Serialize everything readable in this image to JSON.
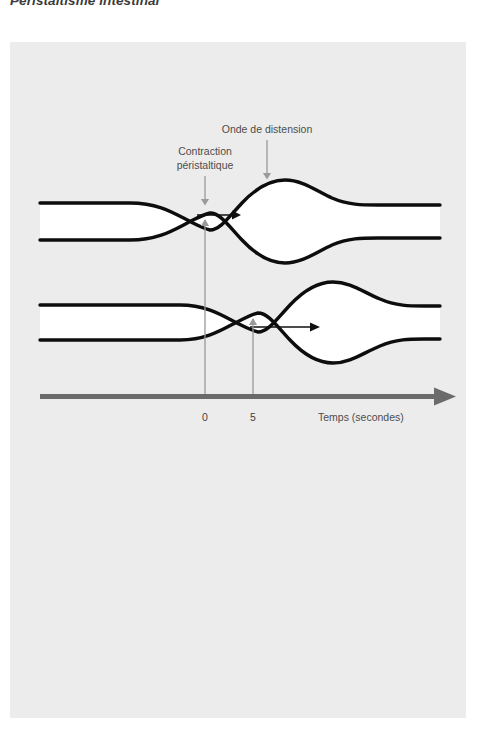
{
  "figure": {
    "title": "Péristaltisme intestinal",
    "panel_bg": "#ececed",
    "labels": {
      "contraction_line1": "Contraction",
      "contraction_line2": "péristaltique",
      "distension": "Onde de distension",
      "axis": "Temps (secondes)"
    },
    "axis": {
      "ticks": [
        {
          "value": "0",
          "x": 205
        },
        {
          "value": "5",
          "x": 253
        }
      ],
      "label": "Temps (secondes)",
      "color": "#6b6b6b"
    },
    "colors": {
      "tube_outline": "#0d0d0d",
      "tube_lumen": "#ffffff",
      "annotation": "#9a9a9a",
      "flow_arrow": "#101010",
      "text": "#4c4c4c",
      "title": "#3b3b3b"
    },
    "tubes": [
      {
        "name": "tube-time-0",
        "constriction_time": "0",
        "constriction_x": 205,
        "distension_x": 267,
        "flow_direction": "right"
      },
      {
        "name": "tube-time-5",
        "constriction_time": "5",
        "constriction_x": 253,
        "distension_x": 318,
        "flow_direction": "right"
      }
    ]
  }
}
